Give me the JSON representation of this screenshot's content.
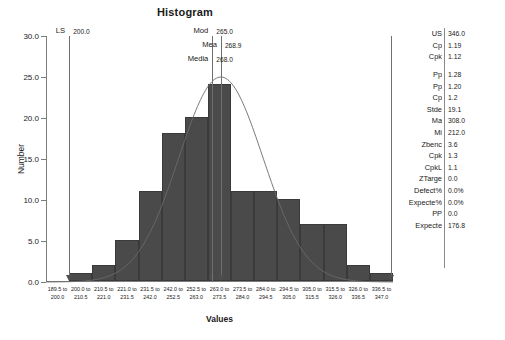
{
  "chart_data": {
    "type": "bar",
    "title": "Histogram",
    "xlabel": "Values",
    "ylabel": "Number",
    "ylim": [
      0,
      30
    ],
    "yticks": [
      "0.0",
      "5.0",
      "10.0",
      "15.0",
      "20.0",
      "25.0",
      "30.0"
    ],
    "grid": false,
    "legend": "none",
    "categories": [
      "189.5 to 200.0",
      "200.0 to 210.5",
      "210.5 to 221.0",
      "221.0 to 231.5",
      "231.5 to 242.0",
      "242.0 to 252.5",
      "252.5 to 263.0",
      "263.0 to 273.5",
      "273.5 to 284.0",
      "284.0 to 294.5",
      "294.5 to 305.0",
      "305.0 to 315.5",
      "315.5 to 326.0",
      "326.0 to 336.5",
      "336.5 to 347.0"
    ],
    "tick_lines": [
      [
        "189.5 to",
        "200.0"
      ],
      [
        "200.0 to",
        "210.5"
      ],
      [
        "210.5 to",
        "221.0"
      ],
      [
        "221.0 to",
        "231.5"
      ],
      [
        "231.5 to",
        "242.0"
      ],
      [
        "242.0 to",
        "252.5"
      ],
      [
        "252.5 to",
        "263.0"
      ],
      [
        "263.0 to",
        "273.5"
      ],
      [
        "273.5 to",
        "284.0"
      ],
      [
        "284.0 to",
        "294.5"
      ],
      [
        "294.5 to",
        "305.0"
      ],
      [
        "305.0 to",
        "315.5"
      ],
      [
        "315.5 to",
        "326.0"
      ],
      [
        "326.0 to",
        "336.5"
      ],
      [
        "336.5 to",
        "347.0"
      ]
    ],
    "values": [
      0,
      1,
      2,
      5,
      11,
      18,
      20,
      24,
      11,
      11,
      10,
      7,
      7,
      2,
      1
    ],
    "overlay": {
      "type": "normal-curve",
      "mean": 268.9,
      "stdev": 19.1,
      "peak": 25.0
    }
  },
  "annotations": [
    {
      "label": "LS",
      "value": "200.0",
      "bin_center": 200.0,
      "has_arrow": true,
      "label_row": 0
    },
    {
      "label": "Mod",
      "value": "265.0",
      "bin_center": 265.0,
      "has_arrow": true,
      "label_row": 0
    },
    {
      "label": "Mea",
      "value": "268.9",
      "bin_center": 268.9,
      "has_arrow": true,
      "label_row": 1
    },
    {
      "label": "Media",
      "value": "268.0",
      "bin_center": 265.0,
      "has_arrow": false,
      "label_row": 2
    },
    {
      "label": "",
      "value": "",
      "bin_center": 346.0,
      "has_arrow": true,
      "label_row": 0
    }
  ],
  "stats": {
    "rows": [
      {
        "key": "US",
        "value": "346.0",
        "gap_before": false
      },
      {
        "key": "Cp",
        "value": "1.19",
        "gap_before": false
      },
      {
        "key": "Cpk",
        "value": "1.12",
        "gap_before": false
      },
      {
        "key": "Pp",
        "value": "1.28",
        "gap_before": true
      },
      {
        "key": "Pp",
        "value": "1.20",
        "gap_before": false
      },
      {
        "key": "Cp",
        "value": "1.2",
        "gap_before": false
      },
      {
        "key": "Stde",
        "value": "19.1",
        "gap_before": false
      },
      {
        "key": "Ma",
        "value": "308.0",
        "gap_before": false
      },
      {
        "key": "Mi",
        "value": "212.0",
        "gap_before": false
      },
      {
        "key": "Zbenc",
        "value": "3.6",
        "gap_before": false
      },
      {
        "key": "Cpk",
        "value": "1.3",
        "gap_before": false
      },
      {
        "key": "CpkL",
        "value": "1.1",
        "gap_before": false
      },
      {
        "key": "ZTarge",
        "value": "0.0",
        "gap_before": false
      },
      {
        "key": "%Defect",
        "value": "0.0%",
        "gap_before": false
      },
      {
        "key": "%Expecte",
        "value": "0.0%",
        "gap_before": false
      },
      {
        "key": "PP",
        "value": "0.0",
        "gap_before": false
      },
      {
        "key": "Expecte",
        "value": "176.8",
        "gap_before": false
      }
    ]
  },
  "colors": {
    "bar_fill": "#4a4a4a",
    "bar_stroke": "#3a3a3a",
    "axis": "#7d7d7d",
    "curve": "#6b6b6b",
    "refline": "#6f6f6f",
    "text": "#1a1a1a"
  }
}
